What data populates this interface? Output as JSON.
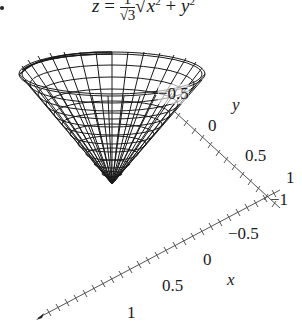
{
  "figure": {
    "formula": {
      "lhs": "z",
      "equals": "=",
      "frac_num": "1",
      "frac_den": "√3",
      "sqrt_symbol": "√",
      "radicand_x": "x",
      "radicand_plus": "+",
      "radicand_y": "y",
      "exponent": "2"
    },
    "surface": {
      "type": "cone wireframe",
      "color": "#1a1a1a"
    },
    "y_axis": {
      "label": "y",
      "ticks": [
        "−0.5",
        "0",
        "0.5",
        "1"
      ]
    },
    "x_axis": {
      "label": "x",
      "ticks": [
        "−1",
        "−0.5",
        "0",
        "0.5",
        "1"
      ]
    }
  }
}
